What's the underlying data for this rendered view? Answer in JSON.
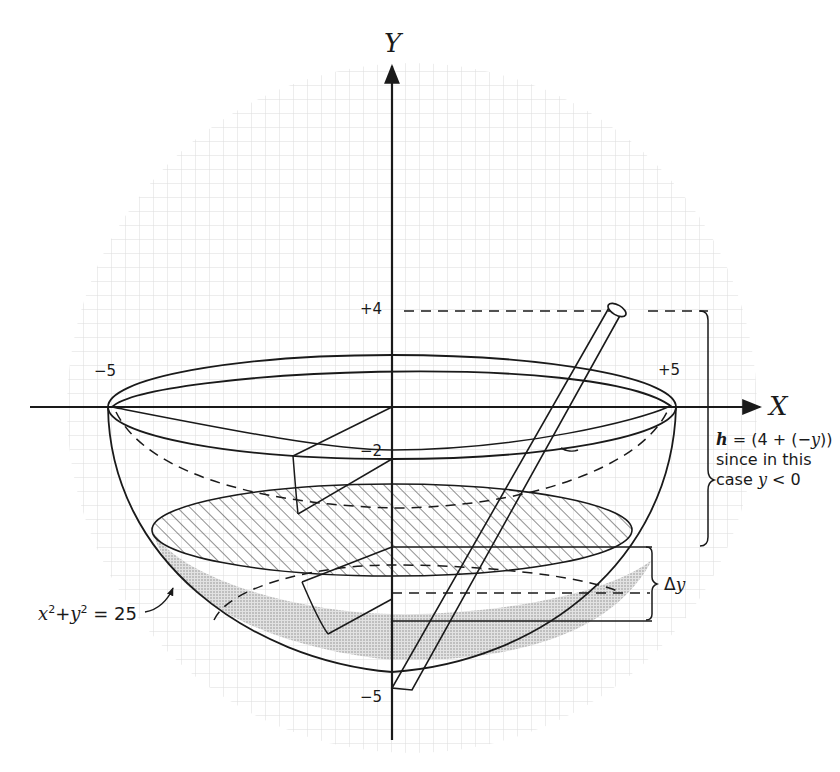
{
  "figure": {
    "colors": {
      "ink": "#1a1a1a",
      "grid": "#d9d9d9",
      "grid_major": "#c8c8c8",
      "stipple": "#bdbdbd",
      "hatch": "#333333",
      "background": "#ffffff"
    }
  },
  "axes": {
    "x_label": "X",
    "y_label": "Y",
    "ticks": {
      "x_neg": "−5",
      "x_pos": "+5",
      "y_pos4": "+4",
      "y_neg2": "−2",
      "y_neg5": "−5"
    }
  },
  "annotations": {
    "h_formula_var": "h",
    "h_formula_rest": " = (4 + (−",
    "h_formula_y": "y",
    "h_formula_close": "))",
    "h_line2": "since in this",
    "h_line3_prefix": "case  ",
    "h_line3_var": "y",
    "h_line3_suffix": " < 0",
    "delta_y": "Δ",
    "delta_y_var": "y",
    "circle_eq_x": "x",
    "circle_eq_sup1": "2",
    "circle_eq_plus": "+",
    "circle_eq_y": "y",
    "circle_eq_sup2": "2",
    "circle_eq_rhs": " = 25"
  }
}
